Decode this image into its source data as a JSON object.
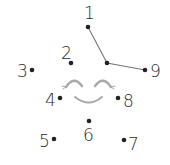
{
  "puzzle": {
    "type": "connect-the-dots",
    "dot_color": "#222222",
    "line_color": "#777777",
    "face_color": "#a8a8a8",
    "dots": [
      {
        "label": "1",
        "x": 88,
        "y": 27,
        "label_x": 84,
        "label_y": 5
      },
      {
        "label": "2",
        "x": 71,
        "y": 63,
        "label_x": 61,
        "label_y": 45
      },
      {
        "label": "3",
        "x": 32,
        "y": 70,
        "label_x": 17,
        "label_y": 63
      },
      {
        "label": "4",
        "x": 60,
        "y": 98,
        "label_x": 45,
        "label_y": 92
      },
      {
        "label": "5",
        "x": 54,
        "y": 139,
        "label_x": 39,
        "label_y": 133
      },
      {
        "label": "6",
        "x": 89,
        "y": 121,
        "label_x": 83,
        "label_y": 127
      },
      {
        "label": "7",
        "x": 124,
        "y": 140,
        "label_x": 128,
        "label_y": 136
      },
      {
        "label": "8",
        "x": 118,
        "y": 98,
        "label_x": 123,
        "label_y": 93
      },
      {
        "label": "9",
        "x": 145,
        "y": 70,
        "label_x": 150,
        "label_y": 63
      }
    ],
    "unlabeled_dots": [
      {
        "x": 107,
        "y": 63
      }
    ],
    "drawn_path": [
      {
        "x": 88,
        "y": 27
      },
      {
        "x": 107,
        "y": 63
      },
      {
        "x": 145,
        "y": 70
      }
    ]
  }
}
